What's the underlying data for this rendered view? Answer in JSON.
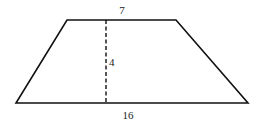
{
  "diagram": {
    "shape": "trapezoid",
    "top_base_label": "7",
    "height_label": "4",
    "bottom_base_label": "16",
    "stroke_color": "#111111"
  }
}
